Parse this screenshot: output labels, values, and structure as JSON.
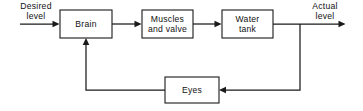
{
  "diagram": {
    "type": "block-diagram",
    "background_color": "#ffffff",
    "line_color": "#1a1a1a",
    "text_color": "#111111",
    "blocks": [
      {
        "id": "brain",
        "label_line1": "Brain",
        "label_line2": ""
      },
      {
        "id": "muscles",
        "label_line1": "Muscles",
        "label_line2": "and valve"
      },
      {
        "id": "tank",
        "label_line1": "Water",
        "label_line2": "tank"
      },
      {
        "id": "eyes",
        "label_line1": "Eyes",
        "label_line2": ""
      }
    ],
    "io_labels": [
      {
        "id": "input",
        "line1": "Desired",
        "line2": "level"
      },
      {
        "id": "output",
        "line1": "Actual",
        "line2": "level"
      }
    ]
  }
}
